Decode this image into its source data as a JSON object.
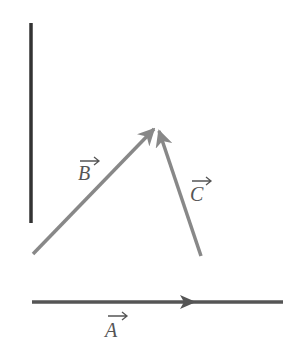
{
  "diagram": {
    "vectors": [
      {
        "name": "A",
        "label": "A",
        "from": [
          32,
          302
        ],
        "to": [
          283,
          302
        ],
        "color": "#555555"
      },
      {
        "name": "B",
        "label": "B",
        "from": [
          33,
          254
        ],
        "to": [
          155,
          128
        ],
        "color": "#888888"
      },
      {
        "name": "C",
        "label": "C",
        "from": [
          201,
          256
        ],
        "to": [
          158,
          130
        ],
        "color": "#888888"
      }
    ],
    "reference_line": {
      "from": [
        31,
        23
      ],
      "to": [
        31,
        223
      ],
      "color": "#333333"
    }
  }
}
